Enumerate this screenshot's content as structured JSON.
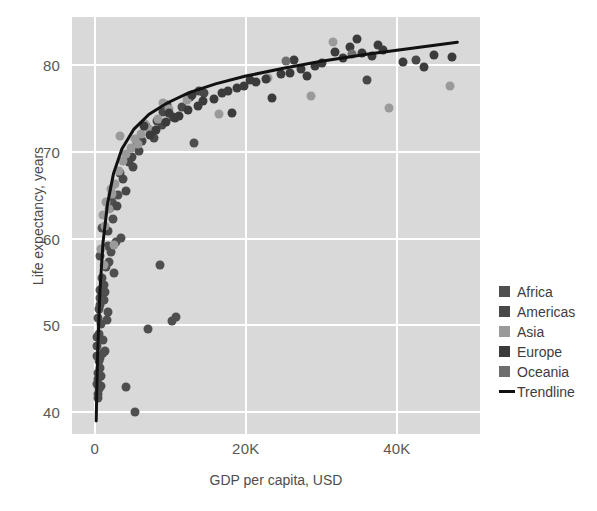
{
  "chart_data": {
    "type": "scatter",
    "title": "",
    "xlabel": "GDP per capita, USD",
    "ylabel": "Life expectancy, years",
    "xlim": [
      -3000,
      51000
    ],
    "ylim": [
      37.5,
      85.5
    ],
    "xticks": [
      0,
      20000,
      40000
    ],
    "xticklabels": [
      "0",
      "20K",
      "40K"
    ],
    "yticks": [
      40,
      50,
      60,
      70,
      80
    ],
    "yticklabels": [
      "40",
      "50",
      "60",
      "70",
      "80"
    ],
    "grid": true,
    "legend_position": "right",
    "plot_background": "#d9d9d9",
    "page_background": "#ffffff",
    "series": [
      {
        "name": "Africa",
        "color": "#4f4f4f",
        "points": [
          [
            430,
            43.8
          ],
          [
            580,
            42.7
          ],
          [
            720,
            46.2
          ],
          [
            350,
            47.6
          ],
          [
            900,
            50.2
          ],
          [
            1200,
            52.9
          ],
          [
            640,
            45.1
          ],
          [
            480,
            41.6
          ],
          [
            1050,
            48.3
          ],
          [
            760,
            54.1
          ],
          [
            1460,
            56.7
          ],
          [
            2200,
            58.4
          ],
          [
            820,
            43.0
          ],
          [
            390,
            44.5
          ],
          [
            1700,
            51.5
          ],
          [
            530,
            49.0
          ],
          [
            1330,
            47.1
          ],
          [
            2800,
            59.6
          ],
          [
            3500,
            60.1
          ],
          [
            670,
            53.2
          ],
          [
            1900,
            57.3
          ],
          [
            410,
            42.1
          ],
          [
            980,
            55.4
          ],
          [
            1150,
            46.8
          ],
          [
            2450,
            62.3
          ],
          [
            740,
            58.0
          ],
          [
            310,
            48.7
          ],
          [
            1600,
            50.6
          ],
          [
            5400,
            40.0
          ],
          [
            4200,
            42.9
          ],
          [
            600,
            51.9
          ],
          [
            880,
            44.2
          ],
          [
            2050,
            63.5
          ],
          [
            1380,
            53.8
          ],
          [
            3100,
            65.0
          ],
          [
            520,
            45.9
          ],
          [
            1750,
            59.1
          ],
          [
            960,
            61.2
          ],
          [
            450,
            50.9
          ],
          [
            2600,
            56.0
          ],
          [
            7100,
            49.6
          ],
          [
            10300,
            50.5
          ],
          [
            10700,
            51.0
          ],
          [
            8700,
            57.0
          ],
          [
            13200,
            71.0
          ],
          [
            340,
            43.3
          ],
          [
            1240,
            54.7
          ],
          [
            290,
            46.5
          ],
          [
            2350,
            64.2
          ],
          [
            690,
            52.4
          ]
        ]
      },
      {
        "name": "Americas",
        "color": "#484848",
        "points": [
          [
            4200,
            65.5
          ],
          [
            5600,
            70.8
          ],
          [
            7400,
            72.3
          ],
          [
            9100,
            74.6
          ],
          [
            6200,
            71.2
          ],
          [
            3700,
            66.9
          ],
          [
            11500,
            75.1
          ],
          [
            8200,
            73.5
          ],
          [
            4900,
            69.4
          ],
          [
            12600,
            76.3
          ],
          [
            2900,
            63.8
          ],
          [
            6800,
            72.9
          ],
          [
            10400,
            74.0
          ],
          [
            5100,
            68.2
          ],
          [
            14500,
            76.8
          ],
          [
            3400,
            67.5
          ],
          [
            8900,
            73.1
          ],
          [
            7800,
            71.6
          ],
          [
            36000,
            78.2
          ],
          [
            42500,
            80.5
          ],
          [
            1800,
            60.9
          ],
          [
            9600,
            75.4
          ],
          [
            5900,
            70.1
          ],
          [
            4500,
            68.8
          ],
          [
            13800,
            77.0
          ]
        ]
      },
      {
        "name": "Asia",
        "color": "#9a9a9a",
        "points": [
          [
            1100,
            62.7
          ],
          [
            2300,
            65.1
          ],
          [
            4800,
            70.4
          ],
          [
            3200,
            67.8
          ],
          [
            6100,
            72.0
          ],
          [
            8400,
            73.8
          ],
          [
            1550,
            64.2
          ],
          [
            2750,
            66.3
          ],
          [
            5400,
            71.5
          ],
          [
            9900,
            74.9
          ],
          [
            1950,
            63.4
          ],
          [
            12200,
            76.0
          ],
          [
            7200,
            72.6
          ],
          [
            3800,
            68.9
          ],
          [
            850,
            58.8
          ],
          [
            28600,
            76.4
          ],
          [
            31500,
            82.6
          ],
          [
            23000,
            78.5
          ],
          [
            2600,
            59.3
          ],
          [
            1420,
            61.5
          ],
          [
            4100,
            69.7
          ],
          [
            9100,
            75.6
          ],
          [
            1270,
            57.0
          ],
          [
            16400,
            74.3
          ],
          [
            5700,
            70.9
          ],
          [
            47000,
            77.6
          ],
          [
            39000,
            75.0
          ],
          [
            2100,
            65.7
          ],
          [
            3400,
            71.8
          ],
          [
            6700,
            73.2
          ]
        ]
      },
      {
        "name": "Europe",
        "color": "#3b3b3b",
        "points": [
          [
            9500,
            73.4
          ],
          [
            12400,
            74.8
          ],
          [
            15800,
            76.1
          ],
          [
            18900,
            77.3
          ],
          [
            21400,
            78.0
          ],
          [
            24600,
            78.9
          ],
          [
            27300,
            79.5
          ],
          [
            30100,
            80.2
          ],
          [
            32900,
            80.8
          ],
          [
            35400,
            81.3
          ],
          [
            38200,
            81.7
          ],
          [
            40800,
            80.3
          ],
          [
            43600,
            79.8
          ],
          [
            47300,
            80.9
          ],
          [
            11200,
            74.1
          ],
          [
            13700,
            75.3
          ],
          [
            16900,
            76.7
          ],
          [
            19800,
            77.6
          ],
          [
            22700,
            78.4
          ],
          [
            25900,
            79.1
          ],
          [
            29200,
            79.9
          ],
          [
            33800,
            82.1
          ],
          [
            36700,
            81.0
          ],
          [
            8100,
            72.5
          ],
          [
            10600,
            73.9
          ],
          [
            14300,
            75.8
          ],
          [
            17600,
            77.0
          ],
          [
            20500,
            78.2
          ],
          [
            26400,
            80.6
          ],
          [
            34700,
            83.0
          ],
          [
            7300,
            71.9
          ],
          [
            9800,
            74.4
          ],
          [
            12900,
            76.5
          ],
          [
            23500,
            76.2
          ],
          [
            28100,
            78.7
          ],
          [
            31800,
            81.5
          ],
          [
            44900,
            81.1
          ],
          [
            6500,
            73.0
          ],
          [
            18200,
            74.5
          ],
          [
            37500,
            82.3
          ]
        ]
      },
      {
        "name": "Oceania",
        "color": "#6e6e6e",
        "points": [
          [
            34000,
            81.2
          ],
          [
            25300,
            80.4
          ]
        ]
      }
    ],
    "trendline": {
      "name": "Trendline",
      "color": "#111111",
      "description": "logarithmic fit through scatter",
      "points": [
        [
          200,
          39.0
        ],
        [
          400,
          47.0
        ],
        [
          700,
          54.0
        ],
        [
          1100,
          59.5
        ],
        [
          1700,
          64.0
        ],
        [
          2500,
          67.5
        ],
        [
          3600,
          70.3
        ],
        [
          5200,
          72.6
        ],
        [
          7200,
          74.3
        ],
        [
          9600,
          75.6
        ],
        [
          12500,
          76.8
        ],
        [
          16000,
          77.8
        ],
        [
          20000,
          78.7
        ],
        [
          25000,
          79.6
        ],
        [
          30000,
          80.4
        ],
        [
          36000,
          81.2
        ],
        [
          42000,
          81.9
        ],
        [
          48000,
          82.6
        ]
      ]
    }
  },
  "legend": {
    "items": [
      {
        "label": "Africa",
        "color": "#4f4f4f",
        "marker": "square"
      },
      {
        "label": "Americas",
        "color": "#484848",
        "marker": "square"
      },
      {
        "label": "Asia",
        "color": "#9a9a9a",
        "marker": "square"
      },
      {
        "label": "Europe",
        "color": "#3b3b3b",
        "marker": "square"
      },
      {
        "label": "Oceania",
        "color": "#6e6e6e",
        "marker": "square"
      },
      {
        "label": "Trendline",
        "color": "#111111",
        "marker": "line"
      }
    ]
  }
}
